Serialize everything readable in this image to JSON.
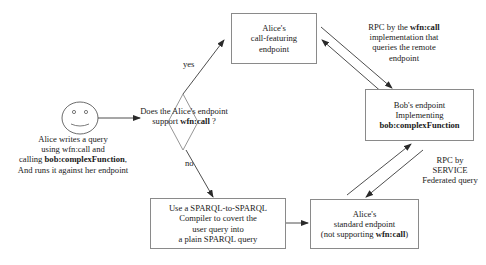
{
  "actor": {
    "icon": "smiley-face-icon",
    "caption": {
      "line1": "Alice writes a query",
      "line2": "using wfn:call and",
      "line3_prefix": "calling ",
      "line3_bold": "bob:complexFunction",
      "line3_suffix": ",",
      "line4": "And runs it against her endpoint"
    }
  },
  "decision": {
    "line1": "Does the Alice's endpoint",
    "line2_prefix": "support ",
    "line2_bold": "wfn:call",
    "line2_suffix": " ?",
    "yes_label": "yes",
    "no_label": "no"
  },
  "nodes": {
    "call_featuring": {
      "line1": "Alice's",
      "line2": "call-featuring",
      "line3": "endpoint"
    },
    "bob": {
      "line1": "Bob's endpoint",
      "line2": "Implementing",
      "line3_bold": "bob:complexFunction"
    },
    "compiler": {
      "line1": "Use a SPARQL-to-SPARQL",
      "line2": "Compiler to covert the",
      "line3": "user query into",
      "line4": "a plain SPARQL query"
    },
    "standard": {
      "line1": "Alice's",
      "line2": "standard endpoint",
      "line3_prefix": "(not supporting ",
      "line3_bold": "wfn:call",
      "line3_suffix": ")"
    }
  },
  "edge_labels": {
    "rpc_wfn": {
      "line1_prefix": "RPC by the ",
      "line1_bold": "wfn:call",
      "line2": "implementation that",
      "line3": "queries the remote",
      "line4": "endpoint"
    },
    "rpc_service": {
      "line1": "RPC by",
      "line2": "SERVICE",
      "line3": "Federated query"
    }
  },
  "colors": {
    "line": "#3a3a3a",
    "box_border": "#8a8a8a",
    "text": "#1a1a1a"
  }
}
